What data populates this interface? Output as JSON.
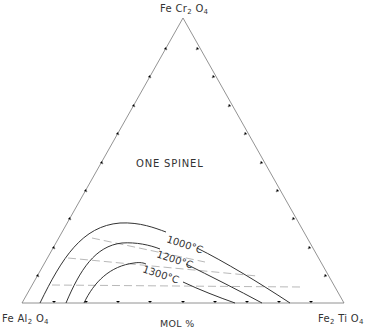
{
  "diagram": {
    "type": "ternary-phase-diagram",
    "vertices": {
      "top": {
        "formula": "FeCr2O4",
        "parts": [
          "Fe Cr",
          "2",
          " O",
          "4"
        ]
      },
      "bottom_left": {
        "formula": "FeAl2O4",
        "parts": [
          "Fe Al",
          "2",
          " O",
          "4"
        ]
      },
      "bottom_right": {
        "formula": "Fe2TiO4",
        "parts": [
          "Fe",
          "2",
          " Ti O",
          "4"
        ]
      }
    },
    "axis_unit": "MOL %",
    "field_label": "ONE SPINEL",
    "isotherms": [
      {
        "label": "1000°C",
        "temperature_c": 1000
      },
      {
        "label": "1200°C",
        "temperature_c": 1200
      },
      {
        "label": "1300°C",
        "temperature_c": 1300
      }
    ],
    "tie_line_count": 3,
    "tick_interval_mol_pct": 10,
    "colors": {
      "line": "#444444",
      "tie_line": "#999999",
      "text": "#333333"
    }
  }
}
